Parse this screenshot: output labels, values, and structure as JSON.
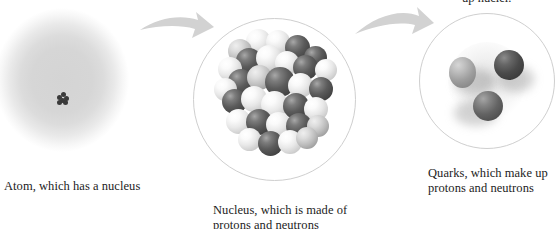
{
  "figure": {
    "title_fragment_cut_off_at_top": "up nuclei.",
    "background_color": "#ffffff",
    "text_color": "#1c1c1c",
    "arrow_color": "#d2d2d2",
    "circle_outline_color": "#cfcfcf"
  },
  "panels": [
    {
      "id": "atom",
      "caption": "Atom, which has a nucleus",
      "illustration": "diffuse gray spherical electron cloud with tiny dark nucleus at its center",
      "cloud_color": "#d6d6d6",
      "nucleus_dot_color": "#3a3a3a"
    },
    {
      "id": "nucleus",
      "caption": "Nucleus, which is made of\nprotons and neutrons",
      "illustration": "cluster of packed dark and light spheres inside a thin circle",
      "dark_sphere_color": "#4a4a4a",
      "light_sphere_color": "#e8e8e8"
    },
    {
      "id": "quarks",
      "caption": "Quarks, which make up\nprotons and neutrons",
      "illustration": "three shaded quark spheres with soft shadows inside a thin circle",
      "quark_colors": [
        "#9d9d9d",
        "#4a4a4a",
        "#636363"
      ]
    }
  ],
  "arrows": [
    {
      "id": "arrow-atom-to-nucleus",
      "from": "atom",
      "to": "nucleus",
      "color": "#d2d2d2"
    },
    {
      "id": "arrow-nucleus-to-quarks",
      "from": "nucleus",
      "to": "quarks",
      "color": "#d2d2d2"
    }
  ]
}
